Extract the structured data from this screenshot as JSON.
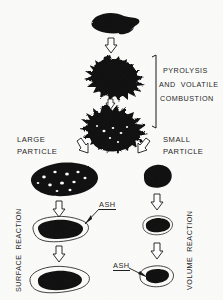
{
  "figure": {
    "background_color": "#fbfbfa",
    "ink_color": "#101010"
  },
  "labels": {
    "pyrolysis_line1": "PYROLYSIS",
    "pyrolysis_line2": "AND  VOLATILE",
    "pyrolysis_line3": "COMBUSTION",
    "large_particle_line1": "LARGE",
    "large_particle_line2": "PARTICLE",
    "small_particle_line1": "SMALL",
    "small_particle_line2": "PARTICLE",
    "surface_reaction": "SURFACE  REACTION",
    "volume_reaction": "VOLUME  REACTION",
    "ash_left": "ASH",
    "ash_right": "ASH"
  },
  "stages": {
    "raw_particle": "raw-coal-particle",
    "devolatilizing_1": "devolatilizing-particle-early",
    "devolatilizing_2": "devolatilizing-particle-late",
    "porous_char": "porous-char-particle",
    "shrinking_core": "shrinking-core-with-ash-layer",
    "burnout_left": "burnt-out-ash-particle-left",
    "small_char": "small-char-particle",
    "small_reacting": "small-reacting-particle",
    "small_burnout": "small-burnt-out-ash-particle"
  },
  "arrows": {
    "top": "down-arrow",
    "mid": "down-arrow",
    "branch_left": "diagonal-arrow-left",
    "branch_right": "diagonal-arrow-right",
    "left_col_1": "down-arrow",
    "left_col_2": "down-arrow",
    "right_col_1": "down-arrow",
    "right_col_2": "down-arrow"
  },
  "bracket": {
    "name": "pyrolysis-bracket"
  }
}
